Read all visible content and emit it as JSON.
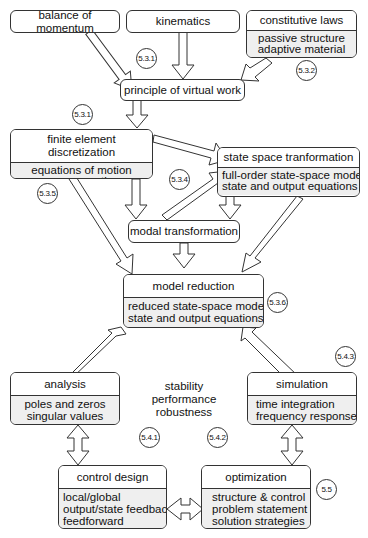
{
  "boxes": {
    "balance_of_momentum": {
      "title": "balance of momentum"
    },
    "kinematics": {
      "title": "kinematics"
    },
    "constitutive_laws": {
      "title": "constitutive laws",
      "lines": [
        "passive structure",
        "adaptive material"
      ]
    },
    "principle_of_virtual_work": {
      "title": "principle of virtual work"
    },
    "finite_element": {
      "title": "finite element discretization",
      "lines": [
        "equations of motion",
        "sensor equations"
      ]
    },
    "state_space": {
      "title": "state space tranformation",
      "lines": [
        "full-order state-space model",
        "state and output equations"
      ]
    },
    "modal_transformation": {
      "title": "modal transformation"
    },
    "model_reduction": {
      "title": "model reduction",
      "lines": [
        "reduced state-space model",
        "state and output equations"
      ]
    },
    "analysis": {
      "title": "analysis",
      "lines": [
        "poles and zeros",
        "singular values"
      ]
    },
    "simulation": {
      "title": "simulation",
      "lines": [
        "time integration",
        "frequency response"
      ]
    },
    "control_design": {
      "title": "control design",
      "lines": [
        "local/global",
        "output/state feedback",
        "feedforward"
      ]
    },
    "optimization": {
      "title": "optimization",
      "lines": [
        "structure & control",
        "problem statement",
        "solution strategies"
      ]
    }
  },
  "center_text": [
    "stability",
    "performance",
    "robustness"
  ],
  "refs": {
    "r531a": "5.3.1",
    "r532": "5.3.2",
    "r531b": "5.3.1",
    "r534": "5.3.4",
    "r535": "5.3.5",
    "r536": "5.3.6",
    "r541": "5.4.1",
    "r542": "5.4.2",
    "r543": "5.4.3",
    "r55": "5.5"
  }
}
